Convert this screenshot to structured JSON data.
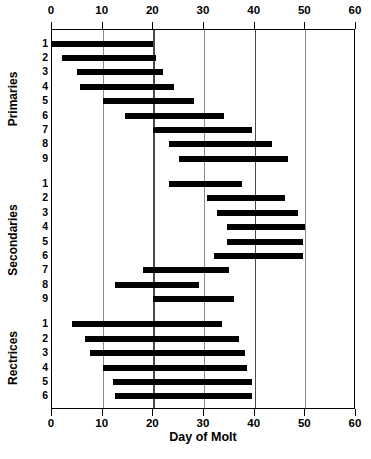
{
  "chart_data": {
    "type": "bar",
    "orientation": "horizontal",
    "subtype": "range-bar",
    "title": "",
    "xlabel": "Day of Molt",
    "ylabel": "",
    "xlim": [
      0,
      60
    ],
    "xticks": [
      0,
      10,
      20,
      30,
      40,
      50,
      60
    ],
    "xticklabels": [
      "0",
      "10",
      "20",
      "30",
      "40",
      "50",
      "60"
    ],
    "grid": true,
    "grid_axis": "x",
    "legend": false,
    "axis_top": true,
    "axis_bottom": true,
    "bar_color": "#000000",
    "groups": [
      {
        "name": "Primaries",
        "categories": [
          "1",
          "2",
          "3",
          "4",
          "5",
          "6",
          "7",
          "8",
          "9"
        ],
        "bars": [
          {
            "label": "1",
            "start": 0.0,
            "end": 20.0
          },
          {
            "label": "2",
            "start": 2.0,
            "end": 20.5
          },
          {
            "label": "3",
            "start": 5.0,
            "end": 22.0
          },
          {
            "label": "4",
            "start": 5.5,
            "end": 24.0
          },
          {
            "label": "5",
            "start": 10.0,
            "end": 28.0
          },
          {
            "label": "6",
            "start": 14.5,
            "end": 34.0
          },
          {
            "label": "7",
            "start": 20.0,
            "end": 39.5
          },
          {
            "label": "8",
            "start": 23.0,
            "end": 43.5
          },
          {
            "label": "9",
            "start": 25.0,
            "end": 46.5
          }
        ]
      },
      {
        "name": "Secondaries",
        "categories": [
          "1",
          "2",
          "3",
          "4",
          "5",
          "6",
          "7",
          "8",
          "9"
        ],
        "bars": [
          {
            "label": "1",
            "start": 23.0,
            "end": 37.5
          },
          {
            "label": "2",
            "start": 30.5,
            "end": 46.0
          },
          {
            "label": "3",
            "start": 32.5,
            "end": 48.5
          },
          {
            "label": "4",
            "start": 34.5,
            "end": 50.0
          },
          {
            "label": "5",
            "start": 34.5,
            "end": 49.5
          },
          {
            "label": "6",
            "start": 32.0,
            "end": 49.5
          },
          {
            "label": "7",
            "start": 18.0,
            "end": 35.0
          },
          {
            "label": "8",
            "start": 12.5,
            "end": 29.0
          },
          {
            "label": "9",
            "start": 20.0,
            "end": 36.0
          }
        ]
      },
      {
        "name": "Rectrices",
        "categories": [
          "1",
          "2",
          "3",
          "4",
          "5",
          "6"
        ],
        "bars": [
          {
            "label": "1",
            "start": 4.0,
            "end": 33.5
          },
          {
            "label": "2",
            "start": 6.5,
            "end": 37.0
          },
          {
            "label": "3",
            "start": 7.5,
            "end": 38.0
          },
          {
            "label": "4",
            "start": 10.0,
            "end": 38.5
          },
          {
            "label": "5",
            "start": 12.0,
            "end": 39.5
          },
          {
            "label": "6",
            "start": 12.5,
            "end": 39.5
          }
        ]
      }
    ]
  },
  "axis": {
    "x_title": "Day of Molt"
  },
  "colors": {
    "bar": "#000000",
    "gridline": "#8a8a8a",
    "gridline_major": "#4a4a4a",
    "frame": "#000000",
    "background": "#ffffff"
  }
}
